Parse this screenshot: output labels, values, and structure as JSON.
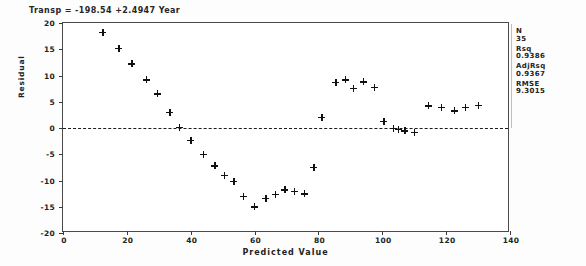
{
  "title": "Transp = -198.54 +2.4947 Year",
  "axes": {
    "x_label": "Predicted Value",
    "y_label": "Residual",
    "x_ticks": [
      "0",
      "20",
      "40",
      "60",
      "80",
      "100",
      "120",
      "140"
    ],
    "y_ticks": [
      "20",
      "15",
      "10",
      "5",
      "0",
      "-5",
      "-10",
      "-15",
      "-20"
    ]
  },
  "stats": {
    "n_key": "N",
    "n_val": "35",
    "rsq_key": "Rsq",
    "rsq_val": "0.9386",
    "adjrsq_key": "AdjRsq",
    "adjrsq_val": "0.9367",
    "rmse_key": "RMSE",
    "rmse_val": "9.3015"
  },
  "chart_data": {
    "type": "scatter",
    "title": "Transp = -198.54 +2.4947 Year",
    "xlabel": "Predicted Value",
    "ylabel": "Residual",
    "xlim": [
      0,
      140
    ],
    "ylim": [
      -20,
      20
    ],
    "grid": false,
    "legend": "none",
    "marker": "plus",
    "reference_line": {
      "type": "horizontal",
      "y": 0,
      "style": "dashed"
    },
    "annotations": {
      "N": 35,
      "Rsq": 0.9386,
      "AdjRsq": 0.9367,
      "RMSE": 9.3015
    },
    "series": [
      {
        "name": "Residuals",
        "points": [
          [
            12.5,
            18.2
          ],
          [
            17.5,
            15.2
          ],
          [
            21.5,
            12.2
          ],
          [
            26.0,
            9.2
          ],
          [
            29.5,
            6.5
          ],
          [
            33.5,
            3.0
          ],
          [
            36.5,
            0.1
          ],
          [
            40.0,
            -2.3
          ],
          [
            44.0,
            -5.0
          ],
          [
            47.5,
            -7.2
          ],
          [
            50.5,
            -9.0
          ],
          [
            53.5,
            -10.2
          ],
          [
            56.5,
            -13.0
          ],
          [
            60.0,
            -15.0
          ],
          [
            63.5,
            -13.4
          ],
          [
            66.5,
            -12.6
          ],
          [
            69.5,
            -11.8
          ],
          [
            72.5,
            -12.0
          ],
          [
            75.5,
            -12.5
          ],
          [
            78.5,
            -7.5
          ],
          [
            81.0,
            2.0
          ],
          [
            85.5,
            8.7
          ],
          [
            88.5,
            9.2
          ],
          [
            91.0,
            7.6
          ],
          [
            94.0,
            8.8
          ],
          [
            97.5,
            7.7
          ],
          [
            100.5,
            1.3
          ],
          [
            103.5,
            0.0
          ],
          [
            105.0,
            -0.2
          ],
          [
            107.0,
            -0.5
          ],
          [
            110.0,
            -0.8
          ],
          [
            114.5,
            4.2
          ],
          [
            118.5,
            4.0
          ],
          [
            122.5,
            3.3
          ],
          [
            126.0,
            4.0
          ],
          [
            130.0,
            4.3
          ]
        ]
      }
    ]
  }
}
